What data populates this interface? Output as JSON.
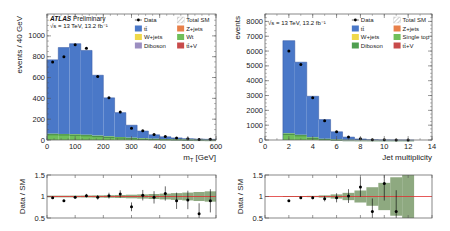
{
  "colors": {
    "ttbar": "#4a78c8",
    "zjets": "#e8804a",
    "wjets": "#efd84a",
    "wt": "#6fbf5a",
    "single_top": "#6fbf5a",
    "diboson_left": "#9b8ec0",
    "diboson_right": "#4f9f50",
    "ttv": "#c84a4a",
    "band": "#7a9a6a",
    "ratio_line": "#e03030",
    "frame": "#555555"
  },
  "left": {
    "atlas_label": "ATLAS",
    "prelim_label": "Preliminary",
    "energy_label": "√s = 13 TeV, 13.2 fb⁻¹",
    "ylabel": "events / 40 GeV",
    "xlabel": "m_T [GeV]",
    "xlabel_main": "m",
    "xlabel_sub": "T",
    "xlabel_unit": " [GeV]",
    "yticks": [
      "0",
      "200",
      "400",
      "600",
      "800",
      "1000"
    ],
    "xticks": [
      "0",
      "100",
      "200",
      "300",
      "400",
      "500",
      "600"
    ],
    "legend": [
      {
        "label": "Data",
        "type": "marker"
      },
      {
        "label": "Total SM",
        "type": "hatch"
      },
      {
        "label": "tt̄",
        "type": "box",
        "color_key": "ttbar"
      },
      {
        "label": "Z+jets",
        "type": "box",
        "color_key": "zjets"
      },
      {
        "label": "W+jets",
        "type": "box",
        "color_key": "wjets"
      },
      {
        "label": "Wt",
        "type": "box",
        "color_key": "wt"
      },
      {
        "label": "Diboson",
        "type": "box",
        "color_key": "diboson_left"
      },
      {
        "label": "tt̄+V",
        "type": "box",
        "color_key": "ttv"
      }
    ],
    "ratio_ylabel": "Data / SM",
    "ratio_yticks": [
      "0.5",
      "1",
      "1.5"
    ]
  },
  "right": {
    "energy_label": "√s = 13 TeV, 13.2 fb⁻¹",
    "ylabel": "events",
    "xlabel": "Jet multiplicity",
    "yticks": [
      "0",
      "1000",
      "2000",
      "3000",
      "4000",
      "5000",
      "6000",
      "7000",
      "8000"
    ],
    "xticks": [
      "0",
      "2",
      "4",
      "6",
      "8",
      "10",
      "12",
      "14"
    ],
    "legend": [
      {
        "label": "Data",
        "type": "marker"
      },
      {
        "label": "Total SM",
        "type": "hatch"
      },
      {
        "label": "tt̄",
        "type": "box",
        "color_key": "ttbar"
      },
      {
        "label": "Z+jets",
        "type": "box",
        "color_key": "zjets"
      },
      {
        "label": "W+jets",
        "type": "box",
        "color_key": "wjets"
      },
      {
        "label": "Single top",
        "type": "box",
        "color_key": "single_top"
      },
      {
        "label": "Diboson",
        "type": "box",
        "color_key": "diboson_right"
      },
      {
        "label": "tt̄+V",
        "type": "box",
        "color_key": "ttv"
      }
    ],
    "ratio_ylabel": "Data / SM",
    "ratio_yticks": [
      "0.5",
      "1",
      "1.5"
    ]
  },
  "chart_data": [
    {
      "type": "bar",
      "title": "ATLAS Preliminary, √s = 13 TeV, 13.2 fb⁻¹",
      "xlabel": "m_T [GeV]",
      "ylabel": "events / 40 GeV",
      "xlim": [
        0,
        600
      ],
      "ylim": [
        0,
        1200
      ],
      "stacked": true,
      "bin_edges": [
        0,
        40,
        80,
        120,
        160,
        200,
        240,
        280,
        320,
        360,
        400,
        440,
        480,
        520,
        560,
        600
      ],
      "series": [
        {
          "name": "Other (Wt + W/Z+jets + Diboson + tt̄+V)",
          "values": [
            60,
            58,
            55,
            50,
            42,
            35,
            28,
            22,
            16,
            12,
            9,
            7,
            5,
            4,
            3
          ]
        },
        {
          "name": "tt̄",
          "values": [
            710,
            830,
            870,
            810,
            580,
            370,
            235,
            120,
            70,
            38,
            22,
            13,
            8,
            5,
            4
          ]
        },
        {
          "name": "Total SM",
          "values": [
            770,
            888,
            925,
            860,
            622,
            405,
            263,
            142,
            86,
            50,
            31,
            20,
            13,
            9,
            7
          ]
        },
        {
          "name": "Data",
          "values": [
            750,
            800,
            915,
            880,
            610,
            405,
            268,
            112,
            90,
            52,
            33,
            20,
            12,
            5,
            8
          ]
        }
      ],
      "ratio": {
        "ylabel": "Data / SM",
        "ylim": [
          0.5,
          1.5
        ],
        "values": [
          0.97,
          0.9,
          0.98,
          1.02,
          0.98,
          1.02,
          1.06,
          0.76,
          1.03,
          0.98,
          1.07,
          0.9,
          0.92,
          0.6,
          0.9
        ]
      },
      "legend": [
        "Data",
        "Total SM",
        "tt̄",
        "Z+jets",
        "W+jets",
        "Wt",
        "Diboson",
        "tt̄+V"
      ],
      "legend_position": "upper right"
    },
    {
      "type": "bar",
      "title": "√s = 13 TeV, 13.2 fb⁻¹",
      "xlabel": "Jet multiplicity",
      "ylabel": "events",
      "xlim": [
        0,
        14
      ],
      "ylim": [
        0,
        8500
      ],
      "stacked": true,
      "bin_edges": [
        1.5,
        2.5,
        3.5,
        4.5,
        5.5,
        6.5,
        7.5,
        8.5,
        9.5,
        10.5,
        11.5,
        12.5
      ],
      "categories": [
        "2",
        "3",
        "4",
        "5",
        "6",
        "7",
        "8",
        "9",
        "10",
        "11",
        "12"
      ],
      "series": [
        {
          "name": "Other (Single top + W/Z+jets + Diboson + tt̄+V)",
          "values": [
            450,
            350,
            180,
            80,
            35,
            12,
            5,
            2,
            1,
            0.5,
            0.2
          ]
        },
        {
          "name": "tt̄",
          "values": [
            6250,
            4900,
            2770,
            1300,
            520,
            185,
            65,
            20,
            7,
            2.5,
            0.8
          ]
        },
        {
          "name": "Total SM",
          "values": [
            6700,
            5250,
            2950,
            1380,
            555,
            197,
            70,
            22,
            8,
            3,
            1
          ]
        },
        {
          "name": "Data",
          "values": [
            6000,
            5100,
            2850,
            1300,
            550,
            200,
            80,
            15,
            9,
            2,
            1
          ]
        }
      ],
      "ratio": {
        "ylabel": "Data / SM",
        "ylim": [
          0.5,
          1.5
        ],
        "values": [
          0.9,
          0.97,
          0.97,
          0.95,
          0.97,
          1.01,
          1.22,
          0.65,
          1.3,
          0.65,
          null
        ]
      },
      "legend": [
        "Data",
        "Total SM",
        "tt̄",
        "Z+jets",
        "W+jets",
        "Single top",
        "Diboson",
        "tt̄+V"
      ],
      "legend_position": "upper right"
    }
  ]
}
